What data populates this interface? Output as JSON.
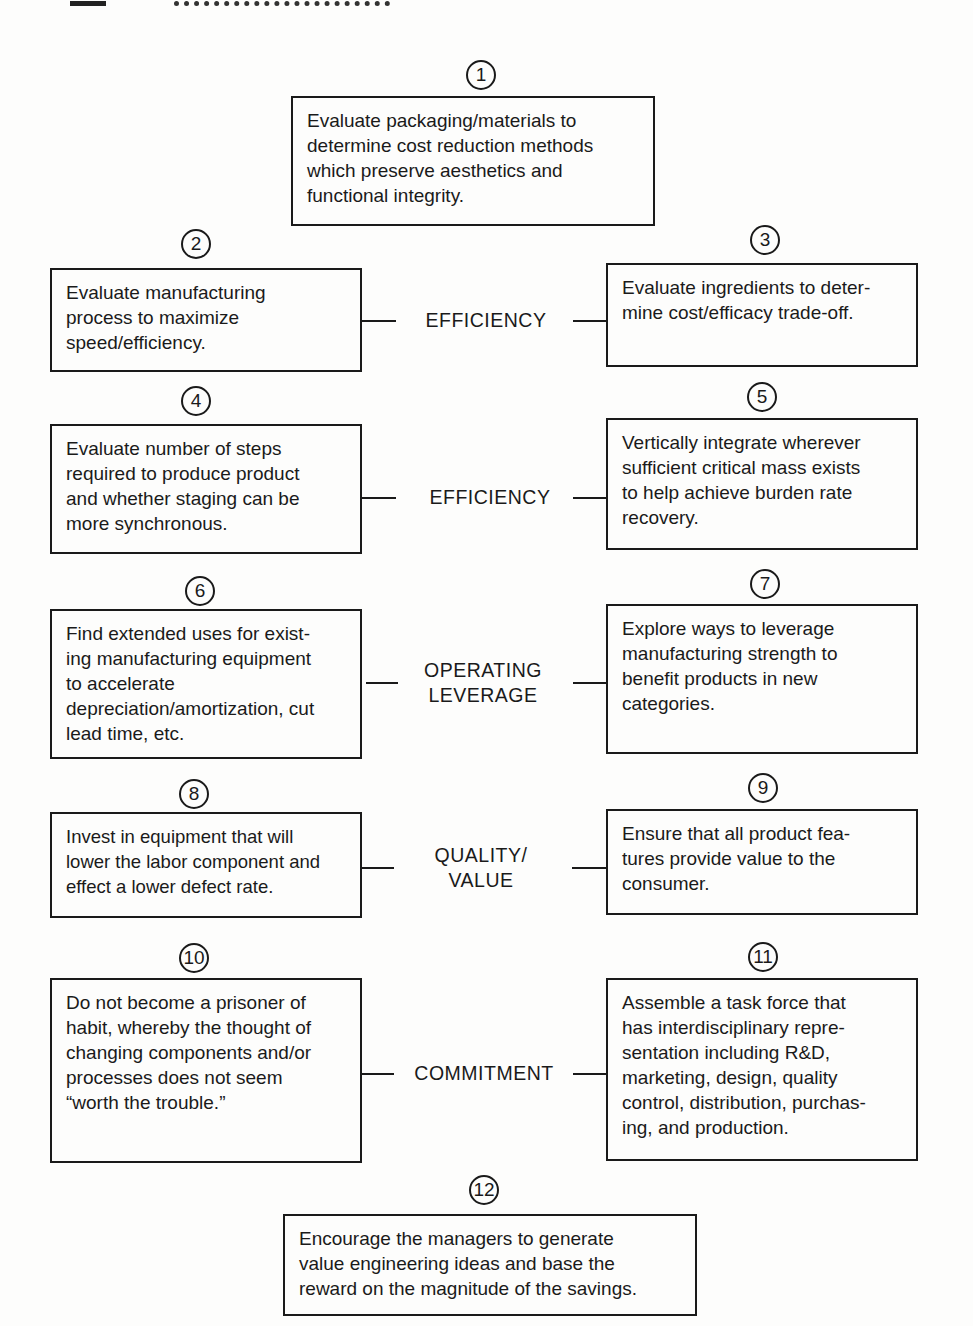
{
  "diagram": {
    "steps": [
      {
        "number": "1",
        "text": "Evaluate packaging/materials to\ndetermine cost reduction methods\nwhich preserve aesthetics and\nfunctional integrity."
      },
      {
        "number": "2",
        "text": "Evaluate manufacturing\nprocess to maximize\nspeed/efficiency."
      },
      {
        "number": "3",
        "text": "Evaluate ingredients to deter-\nmine cost/efficacy trade-off."
      },
      {
        "number": "4",
        "text": "Evaluate number of steps\nrequired to produce product\nand whether staging can be\nmore synchronous."
      },
      {
        "number": "5",
        "text": "Vertically integrate wherever\nsufficient critical mass exists\nto help achieve burden rate\nrecovery."
      },
      {
        "number": "6",
        "text": "Find extended uses for exist-\ning manufacturing equipment\nto accelerate\ndepreciation/amortization, cut\nlead time, etc."
      },
      {
        "number": "7",
        "text": "Explore ways to leverage\nmanufacturing strength to\nbenefit products in new\ncategories."
      },
      {
        "number": "8",
        "text": "Invest in equipment that will\nlower the labor component and\neffect a lower defect rate."
      },
      {
        "number": "9",
        "text": "Ensure that all product fea-\ntures provide value to the\nconsumer."
      },
      {
        "number": "10",
        "text": "Do not become a prisoner of\nhabit, whereby the thought of\nchanging components and/or\nprocesses does not seem\n“worth the trouble.”"
      },
      {
        "number": "11",
        "text": "Assemble a task force that\nhas interdisciplinary repre-\nsentation including R&D,\nmarketing, design, quality\ncontrol, distribution, purchas-\ning, and production."
      },
      {
        "number": "12",
        "text": "Encourage the managers to generate\nvalue engineering ideas and base the\nreward on the magnitude of the savings."
      }
    ],
    "categories": [
      {
        "label": "EFFICIENCY"
      },
      {
        "label": "EFFICIENCY"
      },
      {
        "label": "OPERATING\nLEVERAGE"
      },
      {
        "label": "QUALITY/\nVALUE"
      },
      {
        "label": "COMMITMENT"
      }
    ]
  }
}
